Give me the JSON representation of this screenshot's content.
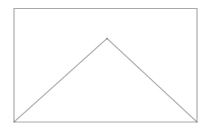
{
  "figure": {
    "background_color": "#ffffff",
    "stroke_color": "#a9a9a9",
    "stroke_color_secondary": "#b0b0b0",
    "vertex_color": "#8d8d8d",
    "canvas": {
      "width": 216,
      "height": 134
    },
    "rectangle": {
      "name": "outer-rectangle",
      "x": 14,
      "y": 8.5,
      "width": 183,
      "height": 113.5,
      "points": "14,8.5 197,8.5 197,122 14,122",
      "corner_top_left": "14,8.5",
      "corner_top_right": "197,8.5",
      "corner_bottom_right": "197,122",
      "corner_bottom_left": "14,122"
    },
    "triangle": {
      "name": "inscribed-triangle",
      "apex": "107,38.5",
      "base_left": "14,122",
      "base_right": "197,122",
      "points": "14,122 107,38.5 197,122",
      "left_leg": {
        "x1": 14,
        "y1": 122,
        "x2": 107,
        "y2": 38.5
      },
      "right_leg": {
        "x1": 107,
        "y1": 38.5,
        "x2": 197,
        "y2": 122
      }
    },
    "vertices": [
      {
        "name": "apex-vertex",
        "cx": 107,
        "cy": 38.7,
        "r": 0.9
      },
      {
        "name": "bottom-left-vertex",
        "cx": 14.4,
        "cy": 121.6,
        "r": 0.9
      },
      {
        "name": "bottom-right-vertex",
        "cx": 196.6,
        "cy": 121.6,
        "r": 0.9
      }
    ]
  }
}
